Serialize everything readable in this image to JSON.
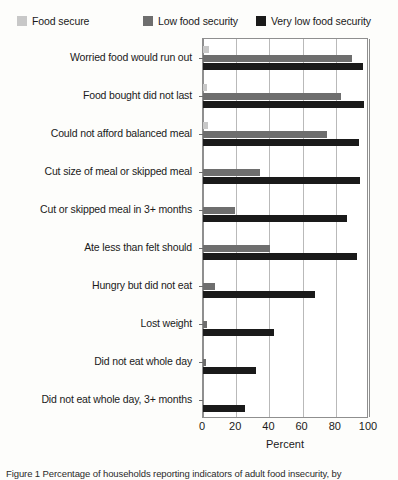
{
  "legend": {
    "items": [
      {
        "label": "Food secure",
        "color": "#c8c8c8",
        "key": "food_secure"
      },
      {
        "label": "Low food security",
        "color": "#6e6e6e",
        "key": "low_food_security"
      },
      {
        "label": "Very low food security",
        "color": "#1a1a1a",
        "key": "very_low_food_security"
      }
    ]
  },
  "axis": {
    "x_title": "Percent",
    "tick_labels": [
      "0",
      "20",
      "40",
      "60",
      "80",
      "100"
    ]
  },
  "caption": {
    "text": "Figure 1 Percentage of households reporting indicators of adult food insecurity, by"
  },
  "chart_data": {
    "type": "bar",
    "orientation": "horizontal",
    "title": "",
    "xlabel": "Percent",
    "ylabel": "",
    "xlim": [
      0,
      100
    ],
    "grid": true,
    "legend_position": "top",
    "categories": [
      "Worried food would run out",
      "Food bought did not last",
      "Could not afford balanced meal",
      "Cut size of meal or skipped meal",
      "Cut or skipped meal in 3+ months",
      "Ate less than felt should",
      "Hungry but did not eat",
      "Lost weight",
      "Did not eat whole day",
      "Did not eat whole day, 3+ months"
    ],
    "series": [
      {
        "name": "Food secure",
        "color": "#c8c8c8",
        "values": [
          3.6,
          2.4,
          3.0,
          0.0,
          0.0,
          0.0,
          0.0,
          0.0,
          0.0,
          0.0
        ]
      },
      {
        "name": "Low food security",
        "color": "#6e6e6e",
        "values": [
          90.0,
          83.0,
          74.5,
          34.5,
          19.0,
          40.5,
          7.0,
          2.5,
          1.6,
          0.0
        ]
      },
      {
        "name": "Very low food security",
        "color": "#1a1a1a",
        "values": [
          96.5,
          97.0,
          94.0,
          94.5,
          87.0,
          92.5,
          67.5,
          42.5,
          32.0,
          25.0
        ]
      }
    ]
  }
}
